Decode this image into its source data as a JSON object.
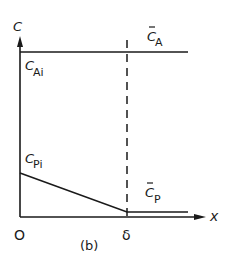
{
  "diagram": {
    "panel_label": "(b)",
    "axes": {
      "y_label": "C",
      "x_label": "x",
      "origin_label": "O",
      "delta_label": "δ"
    },
    "labels": {
      "c_a_bar": {
        "main": "C",
        "sub": "A",
        "bar": true
      },
      "c_ai": {
        "main": "C",
        "sub": "Ai"
      },
      "c_pi": {
        "main": "C",
        "sub": "Pi"
      },
      "c_p_bar": {
        "main": "C",
        "sub": "P",
        "bar": true
      }
    },
    "curves": [
      {
        "name": "C_A profile",
        "description": "constant concentration C_Ai across film and beyond",
        "points": [
          [
            0,
            "C_Ai"
          ],
          [
            "δ",
            "C_Ai"
          ],
          [
            "beyond",
            "C̄_A"
          ]
        ]
      },
      {
        "name": "C_P profile",
        "description": "linear decrease from C_Pi at x=0 to C̄_P at x=δ, then constant",
        "points": [
          [
            0,
            "C_Pi"
          ],
          [
            "δ",
            "C̄_P"
          ],
          [
            "beyond",
            "C̄_P"
          ]
        ]
      }
    ],
    "line_color": "#1a1a1a",
    "background": "#ffffff"
  }
}
